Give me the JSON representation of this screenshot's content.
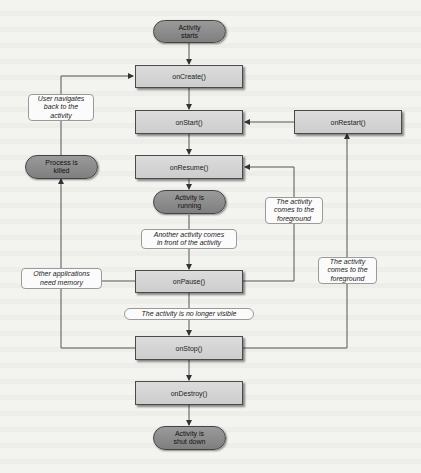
{
  "diagram": {
    "states": {
      "start": "Activity\nstarts",
      "running": "Activity is\nrunning",
      "killed": "Process is\nkilled",
      "shutdown": "Activity is\nshut down"
    },
    "callbacks": {
      "onCreate": "onCreate()",
      "onStart": "onStart()",
      "onRestart": "onRestart()",
      "onResume": "onResume()",
      "onPause": "onPause()",
      "onStop": "onStop()",
      "onDestroy": "onDestroy()"
    },
    "transitions": {
      "user_navigates_back": "User navigates\nback to the\nactivity",
      "another_activity_front": "Another activity comes\nin front of the activity",
      "foreground_from_pause": "The activity\ncomes to the\nforeground",
      "foreground_from_stop": "The activity\ncomes to the\nforeground",
      "other_apps_need_memory": "Other applications\nneed memory",
      "no_longer_visible": "The activity is no longer visible"
    },
    "colors": {
      "background": "#f3f3f0",
      "callback_fill": "#d4d4d4",
      "state_fill": "#8a8a8a",
      "border": "#4a4a4a",
      "line": "#555555"
    }
  }
}
